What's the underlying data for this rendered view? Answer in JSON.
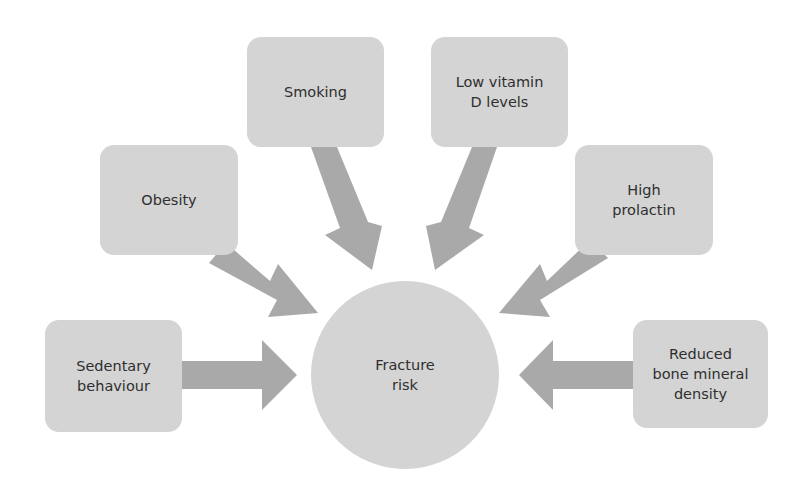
{
  "diagram": {
    "center": {
      "label": "Fracture\nrisk"
    },
    "factors": [
      {
        "id": "sedentary",
        "label": "Sedentary\nbehaviour"
      },
      {
        "id": "obesity",
        "label": "Obesity"
      },
      {
        "id": "smoking",
        "label": "Smoking"
      },
      {
        "id": "vitamin-d",
        "label": "Low vitamin\nD levels"
      },
      {
        "id": "prolactin",
        "label": "High\nprolactin"
      },
      {
        "id": "bmd",
        "label": "Reduced\nbone mineral\ndensity"
      }
    ],
    "colors": {
      "box": "#d4d4d4",
      "arrow": "#a9a9a9",
      "text": "#2f2f2f"
    }
  }
}
